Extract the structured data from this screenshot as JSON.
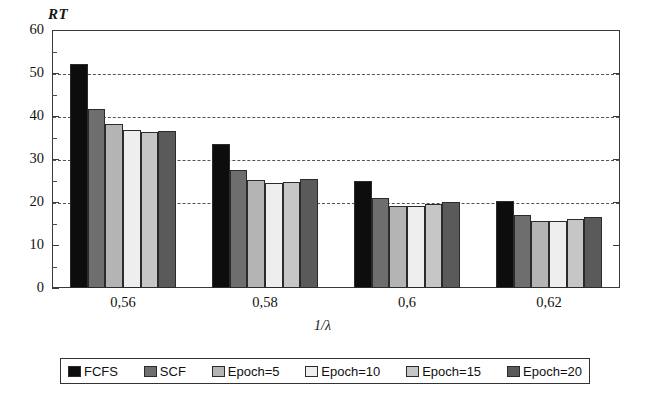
{
  "chart_data": {
    "type": "bar",
    "title": "",
    "ylabel": "RT",
    "xlabel": "1/λ",
    "ylim": [
      0,
      60
    ],
    "ytick_labels": [
      "0",
      "10",
      "20",
      "30",
      "40",
      "50",
      "60"
    ],
    "ytick_values": [
      0,
      10,
      20,
      30,
      40,
      50,
      60
    ],
    "minor_tick_step": 5,
    "grid": "horizontal-dashed",
    "gridline_values": [
      20,
      30,
      40,
      50
    ],
    "legend_position": "bottom",
    "categories": [
      "0,56",
      "0,58",
      "0,6",
      "0,62"
    ],
    "series": [
      {
        "name": "FCFS",
        "color": "#0d0d0d",
        "values": [
          52.2,
          33.5,
          25.0,
          20.2
        ]
      },
      {
        "name": "SCF",
        "color": "#6e6e6e",
        "values": [
          41.6,
          27.5,
          21.0,
          17.0
        ]
      },
      {
        "name": "Epoch=5",
        "color": "#b4b4b4",
        "values": [
          38.1,
          25.1,
          19.0,
          15.6
        ]
      },
      {
        "name": "Epoch=10",
        "color": "#eeeeee",
        "values": [
          36.8,
          24.5,
          19.0,
          15.5
        ]
      },
      {
        "name": "Epoch=15",
        "color": "#c6c6c6",
        "values": [
          36.3,
          24.6,
          19.5,
          16.1
        ]
      },
      {
        "name": "Epoch=20",
        "color": "#5a5a5a",
        "values": [
          36.5,
          25.4,
          20.0,
          16.6
        ]
      }
    ]
  },
  "axes": {
    "y_title": "RT",
    "x_title": "1/λ",
    "y_labels": [
      "60",
      "50",
      "40",
      "30",
      "20",
      "10",
      "0"
    ],
    "x_labels": [
      "0,56",
      "0,58",
      "0,6",
      "0,62"
    ]
  },
  "legend": {
    "items": [
      {
        "label": "FCFS",
        "color": "#0d0d0d"
      },
      {
        "label": "SCF",
        "color": "#6e6e6e"
      },
      {
        "label": "Epoch=5",
        "color": "#b4b4b4"
      },
      {
        "label": "Epoch=10",
        "color": "#eeeeee"
      },
      {
        "label": "Epoch=15",
        "color": "#c6c6c6"
      },
      {
        "label": "Epoch=20",
        "color": "#5a5a5a"
      }
    ]
  }
}
